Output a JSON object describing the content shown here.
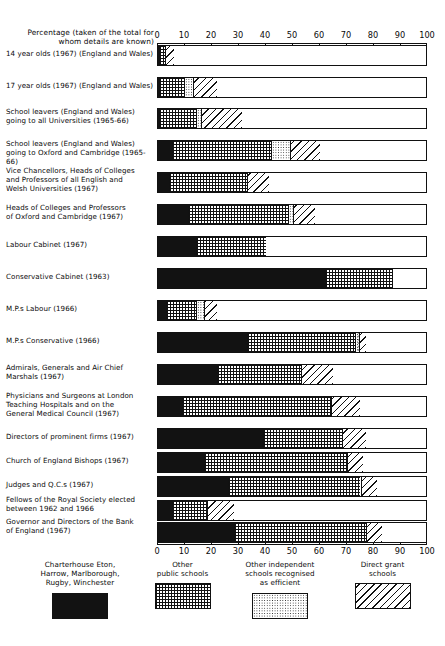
{
  "chart_data": {
    "type": "bar",
    "orientation": "horizontal",
    "stacked": true,
    "title": "",
    "xlabel_lines": [
      "Percentage (taken of the total for",
      "whom details are known)"
    ],
    "xlim": [
      0,
      100
    ],
    "xticks": [
      0,
      10,
      20,
      30,
      40,
      50,
      60,
      70,
      80,
      90,
      100
    ],
    "xtick_labels": [
      "0",
      "10",
      "20",
      "30",
      "40",
      "50",
      "60",
      "70",
      "80",
      "90",
      "100"
    ],
    "grid": false,
    "legend_position": "bottom",
    "series": [
      {
        "name": "Charterhouse, Eton, Harrow, Marlborough, Rugby, Winchester",
        "key": "clarendon",
        "pattern": "solid"
      },
      {
        "name": "Other public schools",
        "key": "other_public",
        "pattern": "grid"
      },
      {
        "name": "Other independent schools recognised as efficient",
        "key": "other_independent",
        "pattern": "dots"
      },
      {
        "name": "Direct grant schools",
        "key": "direct_grant",
        "pattern": "hatch"
      }
    ],
    "categories": [
      "14 year olds (1967) (England and Wales)",
      "17 year olds (1967) (England and Wales)",
      "School leavers (England and Wales) going to all Universities (1965-66)",
      "School leavers (England and Wales) going to Oxford and Cambridge (1965-66)",
      "Vice Chancellors, Heads of Colleges and Professors of all English and Welsh Universities (1967)",
      "Heads of Colleges and Professors of Oxford and Cambridge (1967)",
      "Labour Cabinet (1967)",
      "Conservative Cabinet (1963)",
      "M.P.s Labour (1966)",
      "M.P.s Conservative (1966)",
      "Admirals, Generals and Air Chief Marshals (1967)",
      "Physicians and Surgeons at London Teaching Hospitals and on the General Medical Council (1967)",
      "Directors of prominent firms (1967)",
      "Church of England Bishops (1967)",
      "Judges and Q.C.s (1967)",
      "Fellows of the Royal Society elected between 1962 and 1966",
      "Governor and Directors of the Bank of England (1967)"
    ],
    "values": {
      "clarendon": [
        0.3,
        0.4,
        0.5,
        5.0,
        4.0,
        11.0,
        14.0,
        62.0,
        3.0,
        33.0,
        22.0,
        9.0,
        39.0,
        17.0,
        26.0,
        5.0,
        28.0
      ],
      "other_public": [
        2.3,
        9.1,
        13.5,
        37.0,
        29.0,
        37.0,
        26.0,
        25.0,
        11.0,
        40.0,
        31.0,
        55.0,
        29.0,
        53.0,
        49.0,
        13.0,
        49.0
      ],
      "other_independent": [
        0.0,
        3.4,
        2.0,
        7.0,
        0.0,
        2.0,
        0.0,
        0.0,
        3.0,
        1.5,
        0.0,
        0.0,
        0.0,
        0.0,
        0.0,
        0.0,
        0.0
      ],
      "direct_grant": [
        3.4,
        9.1,
        15.0,
        11.0,
        8.0,
        8.0,
        0.0,
        0.0,
        5.0,
        2.5,
        12.0,
        11.0,
        9.0,
        6.0,
        6.0,
        10.0,
        6.0
      ]
    }
  },
  "rows": [
    {
      "label": [
        "14 year olds (1967) (England and Wales)"
      ]
    },
    {
      "label": [
        "17 year olds (1967) (England and Wales)"
      ]
    },
    {
      "label": [
        "School leavers (England and Wales)",
        "going to all Universities (1965-66)"
      ]
    },
    {
      "label": [
        "School leavers (England and Wales)",
        "going to Oxford and Cambridge (1965-66)"
      ]
    },
    {
      "label": [
        "Vice Chancellors, Heads of Colleges",
        "and Professors of all English and",
        "Welsh Universities  (1967)"
      ]
    },
    {
      "label": [
        "Heads of Colleges and Professors",
        "of Oxford and Cambridge (1967)"
      ]
    },
    {
      "label": [
        "Labour Cabinet (1967)"
      ]
    },
    {
      "label": [
        "Conservative Cabinet (1963)"
      ]
    },
    {
      "label": [
        "M.P.s Labour (1966)"
      ]
    },
    {
      "label": [
        "M.P.s Conservative (1966)"
      ]
    },
    {
      "label": [
        "Admirals, Generals and Air Chief",
        "Marshals (1967)"
      ]
    },
    {
      "label": [
        "Physicians and Surgeons at London",
        "Teaching Hospitals and on the",
        "General Medical Council (1967)"
      ]
    },
    {
      "label": [
        "Directors of prominent firms (1967)"
      ]
    },
    {
      "label": [
        "Church of England Bishops (1967)"
      ]
    },
    {
      "label": [
        "Judges and Q.C.s (1967)"
      ]
    },
    {
      "label": [
        "Fellows of the Royal Society elected",
        "between  1962 and 1966"
      ]
    },
    {
      "label": [
        "Governor and Directors of the Bank",
        "of England (1967)"
      ]
    }
  ],
  "legend": {
    "items": [
      {
        "lines": [
          "Charterhouse Eton,",
          "Harrow, Marlborough,",
          "Rugby, Winchester"
        ],
        "pattern": "solid"
      },
      {
        "lines": [
          "Other",
          "public schools"
        ],
        "pattern": "grid"
      },
      {
        "lines": [
          "Other independent",
          "schools recognised",
          "as efficient"
        ],
        "pattern": "dots"
      },
      {
        "lines": [
          "Direct grant",
          "schools"
        ],
        "pattern": "hatch"
      }
    ]
  },
  "colors": {
    "ink": "#121212",
    "paper": "#ffffff"
  }
}
